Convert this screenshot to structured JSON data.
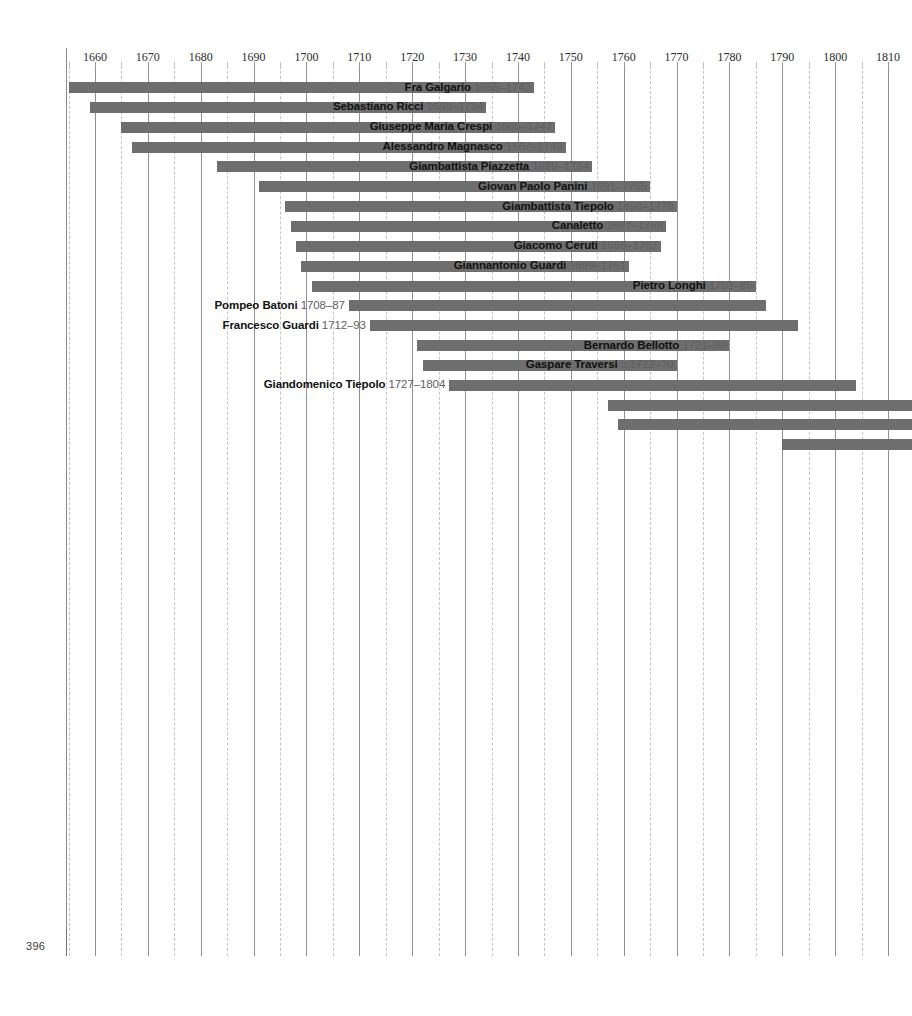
{
  "page": {
    "number": "396",
    "running_head": "OVERVIEW"
  },
  "chart_data": {
    "type": "bar",
    "orientation": "horizontal",
    "title": "",
    "subtitle": "",
    "xlabel": "",
    "ylabel": "",
    "xlim": [
      1650,
      1812
    ],
    "grid": "vertical solid at decades, dashed at half-decades",
    "legend": "none",
    "bar_color": "#6e6e6e",
    "axis_ticks": [
      1660,
      1670,
      1680,
      1690,
      1700,
      1710,
      1720,
      1730,
      1740,
      1750,
      1760,
      1770,
      1780,
      1790,
      1800,
      1810
    ],
    "minor_ticks": [
      1655,
      1665,
      1675,
      1685,
      1695,
      1705,
      1715,
      1725,
      1735,
      1745,
      1755,
      1765,
      1775,
      1785,
      1795,
      1805
    ],
    "rows": [
      {
        "name": "Fra Galgario",
        "dates": "1655–1743",
        "start": 1655,
        "end": 1743,
        "label_side": "left",
        "clipped_right": false
      },
      {
        "name": "Sebastiano Ricci",
        "dates": "1659–1734",
        "start": 1659,
        "end": 1734,
        "label_side": "left",
        "clipped_right": false
      },
      {
        "name": "Giuseppe Maria Crespi",
        "dates": "1665–1747",
        "start": 1665,
        "end": 1747,
        "label_side": "left",
        "clipped_right": false
      },
      {
        "name": "Alessandro Magnasco",
        "dates": "1667–1749",
        "start": 1667,
        "end": 1749,
        "label_side": "left",
        "clipped_right": false
      },
      {
        "name": "Giambattista Piazzetta",
        "dates": "1689–1754",
        "start": 1683,
        "end": 1754,
        "label_side": "left",
        "clipped_right": false
      },
      {
        "name": "Giovan Paolo Panini",
        "dates": "1691–1765",
        "start": 1691,
        "end": 1765,
        "label_side": "left",
        "clipped_right": false
      },
      {
        "name": "Giambattista Tiepolo",
        "dates": "1696–1770",
        "start": 1696,
        "end": 1770,
        "label_side": "left",
        "clipped_right": false
      },
      {
        "name": "Canaletto",
        "dates": "1697–1768",
        "start": 1697,
        "end": 1768,
        "label_side": "left",
        "clipped_right": false
      },
      {
        "name": "Giacomo Ceruti",
        "dates": "1698–1767",
        "start": 1698,
        "end": 1767,
        "label_side": "left",
        "clipped_right": false
      },
      {
        "name": "Giannantonio Guardi",
        "dates": "1699–1761",
        "start": 1699,
        "end": 1761,
        "label_side": "left",
        "clipped_right": false
      },
      {
        "name": "Pietro Longhi",
        "dates": "1701–85",
        "start": 1701,
        "end": 1785,
        "label_side": "left",
        "clipped_right": false
      },
      {
        "name": "Pompeo Batoni",
        "dates": "1708–87",
        "start": 1708,
        "end": 1787,
        "label_side": "right",
        "clipped_right": false
      },
      {
        "name": "Francesco Guardi",
        "dates": "1712–93",
        "start": 1712,
        "end": 1793,
        "label_side": "right",
        "clipped_right": false
      },
      {
        "name": "Bernardo Bellotto",
        "dates": "1721–80",
        "start": 1721,
        "end": 1780,
        "label_side": "left",
        "clipped_right": false
      },
      {
        "name": "Gaspare Traversi",
        "dates": "c.1722–70",
        "start": 1722,
        "end": 1770,
        "label_side": "left",
        "clipped_right": false
      },
      {
        "name": "Giandomenico Tiepolo",
        "dates": "1727–1804",
        "start": 1727,
        "end": 1804,
        "label_side": "right",
        "clipped_right": false
      },
      {
        "name": "",
        "dates": "",
        "start": 1757,
        "end": 1812,
        "label_side": "none",
        "clipped_right": true
      },
      {
        "name": "",
        "dates": "",
        "start": 1759,
        "end": 1812,
        "label_side": "none",
        "clipped_right": true
      },
      {
        "name": "",
        "dates": "",
        "start": 1790,
        "end": 1812,
        "label_side": "none",
        "clipped_right": true
      }
    ]
  }
}
